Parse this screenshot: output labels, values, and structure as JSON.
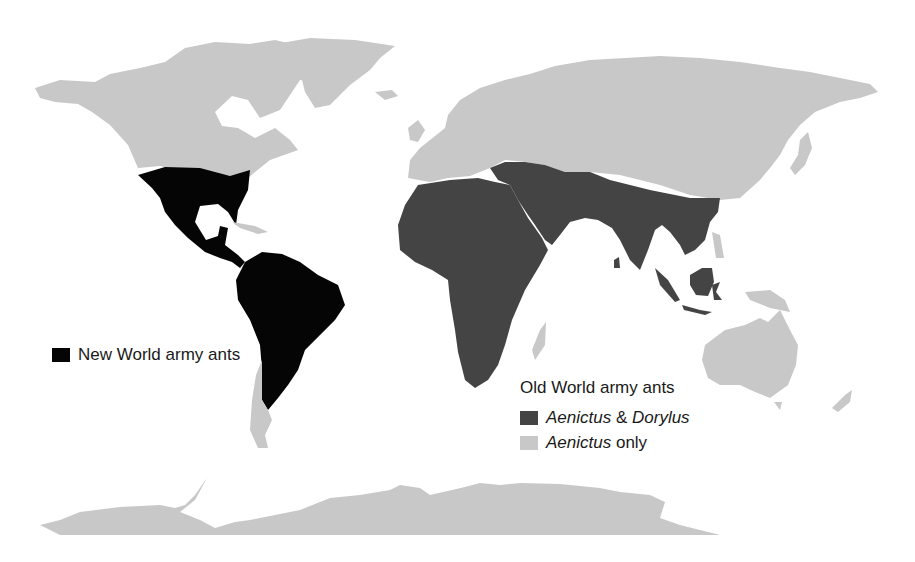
{
  "map": {
    "type": "world distribution map",
    "colors": {
      "new_world": "#050505",
      "aenictus_dorylus": "#444444",
      "aenictus_only": "#c8c8c8",
      "background": "#ffffff"
    }
  },
  "legend": {
    "new_world": {
      "label": "New World army ants",
      "color": "#050505"
    },
    "old_world": {
      "title": "Old World army ants",
      "items": [
        {
          "genus1": "Aenictus",
          "joiner": " & ",
          "genus2": "Dorylus",
          "color": "#444444"
        },
        {
          "genus1": "Aenictus",
          "suffix": " only",
          "color": "#c8c8c8"
        }
      ]
    }
  }
}
